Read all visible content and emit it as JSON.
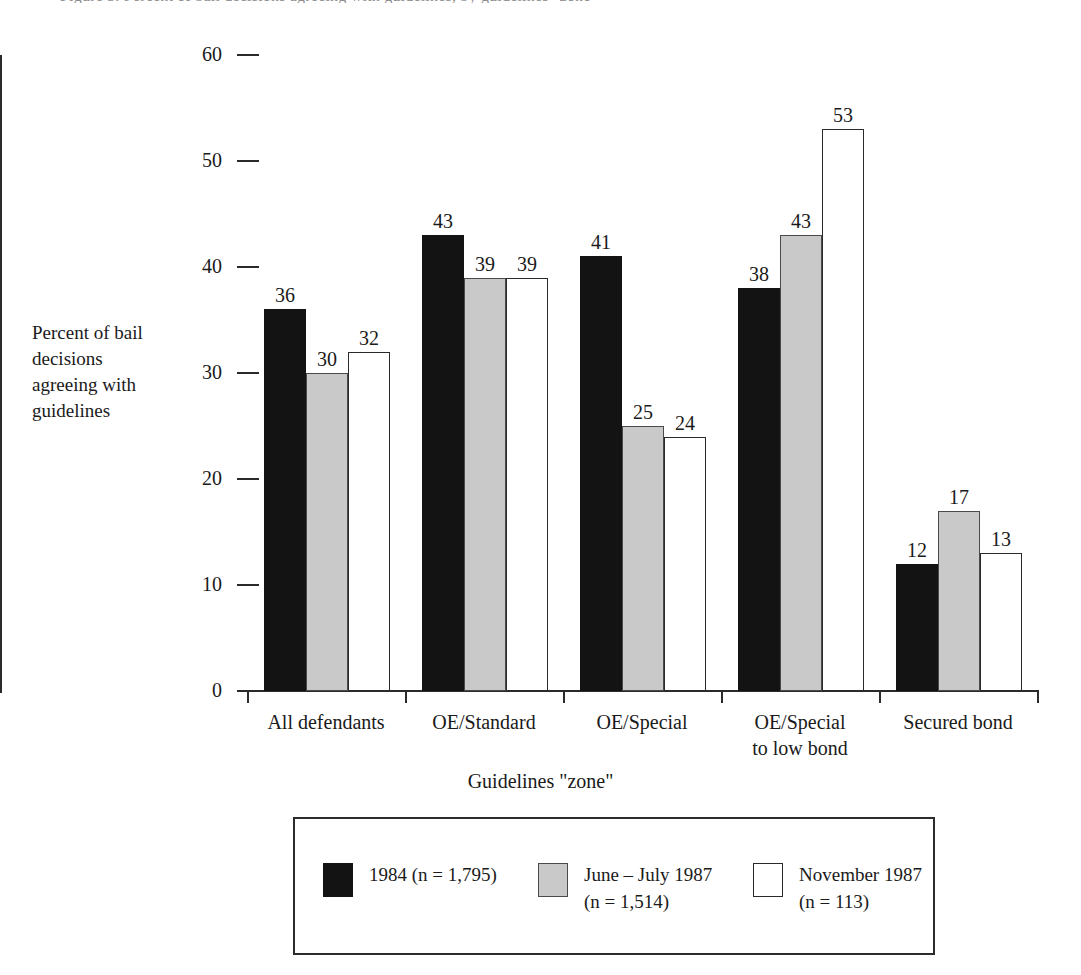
{
  "top_caption": "Figure 3. Percent of bail decisions agreeing with guidelines, by guidelines \"zone\"",
  "axes": {
    "y_title": "Percent of bail\ndecisions\nagreeing with\nguidelines",
    "x_title": "Guidelines \"zone\"",
    "y_ticks": [
      "0",
      "10",
      "20",
      "30",
      "40",
      "50",
      "60"
    ]
  },
  "legend": {
    "entries": [
      {
        "swatch": "black-swatch",
        "label": "1984 (n = 1,795)"
      },
      {
        "swatch": "gray-swatch",
        "label": "June – July 1987\n(n = 1,514)"
      },
      {
        "swatch": "white-swatch",
        "label": "November 1987\n(n = 113)"
      }
    ]
  },
  "chart_data": {
    "type": "bar",
    "title": "",
    "xlabel": "Guidelines \"zone\"",
    "ylabel": "Percent of bail decisions agreeing with guidelines",
    "ylim": [
      0,
      60
    ],
    "ytick_step": 10,
    "grid": false,
    "legend_position": "bottom",
    "categories": [
      "All defendants",
      "OE/Standard",
      "OE/Special",
      "OE/Special\nto low bond",
      "Secured bond"
    ],
    "series": [
      {
        "name": "1984 (n = 1,795)",
        "color": "#131313",
        "values": [
          36,
          43,
          41,
          38,
          12
        ]
      },
      {
        "name": "June – July 1987 (n = 1,514)",
        "color": "#c9c9c9",
        "values": [
          30,
          39,
          25,
          43,
          17
        ]
      },
      {
        "name": "November 1987 (n = 113)",
        "color": "#ffffff",
        "values": [
          32,
          39,
          24,
          53,
          13
        ]
      }
    ]
  }
}
